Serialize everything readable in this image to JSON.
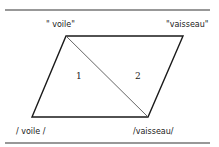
{
  "diagram": {
    "type": "semiotic-parallelogram",
    "labels": {
      "top_left": "\" voile\"",
      "top_right": "\"vaisseau\"",
      "bottom_left": "/ voile /",
      "bottom_right": "/vaisseau/"
    },
    "regions": {
      "left": "1",
      "right": "2"
    },
    "colors": {
      "line": "#1a1a1a",
      "diagonal": "#555555",
      "rule": "#333333"
    }
  }
}
